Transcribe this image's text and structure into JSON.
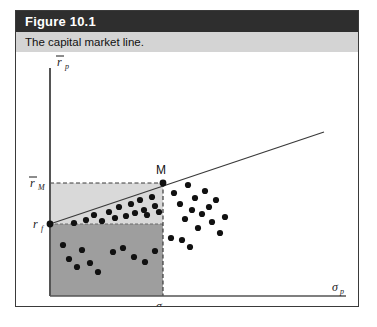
{
  "figure": {
    "number_label": "Figure 10.1",
    "caption": "The capital market line."
  },
  "axes": {
    "y_label_main": "r",
    "y_label_sub": "p",
    "x_label_main": "σ",
    "x_label_sub": "p",
    "y_tick_market_main": "r",
    "y_tick_market_sub": "M",
    "y_tick_riskfree_main": "r",
    "y_tick_riskfree_sub": "f",
    "x_tick_market_main": "σ",
    "x_tick_market_sub": "M"
  },
  "annotations": {
    "market_portfolio_label": "M"
  },
  "colors": {
    "header_bar": "#2e2e2e",
    "caption_bar": "#d4d4d4",
    "upper_region_fill": "#d9d9d9",
    "lower_region_fill": "#9e9e9e",
    "axis_stroke": "#555555",
    "cml_stroke": "#3a3a3a",
    "dot_fill": "#111111",
    "frame_border": "#3a3a3a"
  },
  "chart_data": {
    "type": "scatter",
    "title": "The capital market line.",
    "xlabel": "σp",
    "ylabel": "rp",
    "grid": false,
    "legend": null,
    "axis_origin": {
      "x": 34,
      "y": 244
    },
    "xlim": [
      0,
      310
    ],
    "ylim": [
      0,
      244
    ],
    "reference_levels": {
      "r_f": {
        "label": "rf",
        "y_pixel": 172,
        "description": "risk-free rate intercept of the capital market line"
      },
      "r_M_bar": {
        "label": "rM",
        "y_pixel": 131,
        "description": "expected return of the market portfolio"
      },
      "sigma_M": {
        "label": "σM",
        "x_pixel": 147,
        "description": "standard deviation of the market portfolio"
      }
    },
    "lines": [
      {
        "name": "capital-market-line",
        "from": {
          "x": 34,
          "y": 172
        },
        "to": {
          "x": 308,
          "y": 80
        },
        "style": "solid"
      }
    ],
    "regions": [
      {
        "name": "upper-shaded-rectangle",
        "fill": "#d9d9d9",
        "x0": 34,
        "y0": 131,
        "x1": 147,
        "y1": 172,
        "border": "dashed"
      },
      {
        "name": "lower-shaded-rectangle",
        "fill": "#9e9e9e",
        "x0": 34,
        "y0": 172,
        "x1": 147,
        "y1": 244,
        "border": "dashed"
      }
    ],
    "markers": [
      {
        "name": "market-portfolio-M",
        "x": 147,
        "y": 131,
        "label": "M"
      },
      {
        "name": "risk-free-point",
        "x": 34,
        "y": 172,
        "label": "rf"
      }
    ],
    "points": [
      {
        "x": 58,
        "y": 171
      },
      {
        "x": 70,
        "y": 168
      },
      {
        "x": 78,
        "y": 163
      },
      {
        "x": 86,
        "y": 169
      },
      {
        "x": 93,
        "y": 160
      },
      {
        "x": 99,
        "y": 166
      },
      {
        "x": 103,
        "y": 155
      },
      {
        "x": 110,
        "y": 164
      },
      {
        "x": 115,
        "y": 152
      },
      {
        "x": 119,
        "y": 161
      },
      {
        "x": 124,
        "y": 148
      },
      {
        "x": 128,
        "y": 158
      },
      {
        "x": 131,
        "y": 163
      },
      {
        "x": 136,
        "y": 145
      },
      {
        "x": 139,
        "y": 154
      },
      {
        "x": 143,
        "y": 160
      },
      {
        "x": 47,
        "y": 193
      },
      {
        "x": 53,
        "y": 207
      },
      {
        "x": 61,
        "y": 215
      },
      {
        "x": 66,
        "y": 198
      },
      {
        "x": 74,
        "y": 211
      },
      {
        "x": 82,
        "y": 220
      },
      {
        "x": 97,
        "y": 200
      },
      {
        "x": 107,
        "y": 196
      },
      {
        "x": 118,
        "y": 205
      },
      {
        "x": 129,
        "y": 210
      },
      {
        "x": 139,
        "y": 199
      },
      {
        "x": 155,
        "y": 186
      },
      {
        "x": 158,
        "y": 141
      },
      {
        "x": 164,
        "y": 152
      },
      {
        "x": 169,
        "y": 167
      },
      {
        "x": 172,
        "y": 133
      },
      {
        "x": 176,
        "y": 158
      },
      {
        "x": 179,
        "y": 146
      },
      {
        "x": 182,
        "y": 176
      },
      {
        "x": 186,
        "y": 162
      },
      {
        "x": 189,
        "y": 139
      },
      {
        "x": 193,
        "y": 155
      },
      {
        "x": 196,
        "y": 170
      },
      {
        "x": 200,
        "y": 148
      },
      {
        "x": 204,
        "y": 181
      },
      {
        "x": 174,
        "y": 195
      },
      {
        "x": 166,
        "y": 188
      },
      {
        "x": 209,
        "y": 165
      }
    ]
  }
}
